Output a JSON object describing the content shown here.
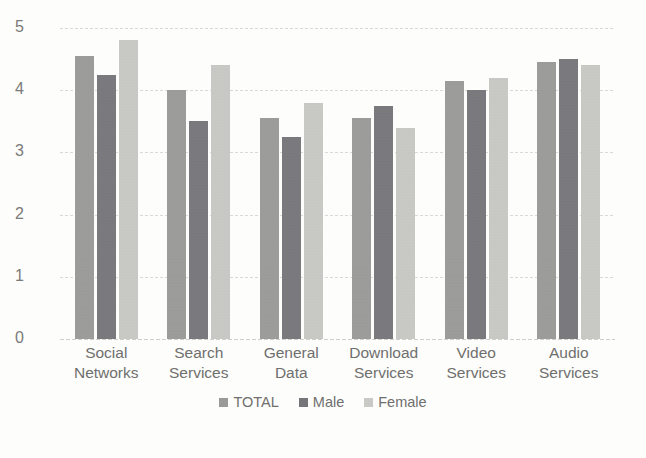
{
  "chart_data": {
    "type": "bar",
    "title": "",
    "subtitle": "",
    "xlabel": "",
    "ylabel": "",
    "ylim": [
      0,
      5
    ],
    "yticks": [
      "0",
      "1",
      "2",
      "3",
      "4",
      "5"
    ],
    "grid": true,
    "legend_position": "bottom-center",
    "categories": [
      "Social Networks",
      "Search Services",
      "General Data",
      "Download Services",
      "Video Services",
      "Audio Services"
    ],
    "category_lines": [
      [
        "Social",
        "Networks"
      ],
      [
        "Search",
        "Services"
      ],
      [
        "General",
        "Data"
      ],
      [
        "Download",
        "Services"
      ],
      [
        "Video",
        "Services"
      ],
      [
        "Audio",
        "Services"
      ]
    ],
    "series": [
      {
        "name": "TOTAL",
        "color": "#9a9a98",
        "values": [
          4.55,
          4.0,
          3.55,
          3.55,
          4.15,
          4.45
        ]
      },
      {
        "name": "Male",
        "color": "#76767a",
        "values": [
          4.25,
          3.5,
          3.25,
          3.75,
          4.0,
          4.5
        ]
      },
      {
        "name": "Female",
        "color": "#c9c9c5",
        "values": [
          4.8,
          4.4,
          3.8,
          3.4,
          4.2,
          4.4
        ]
      }
    ]
  },
  "legend": {
    "items": [
      {
        "label": "TOTAL",
        "color": "#9a9a98"
      },
      {
        "label": "Male",
        "color": "#76767a"
      },
      {
        "label": "Female",
        "color": "#c9c9c5"
      }
    ]
  },
  "axis": {
    "y_tick_labels": [
      "5",
      "4",
      "3",
      "2",
      "1",
      "0"
    ]
  }
}
